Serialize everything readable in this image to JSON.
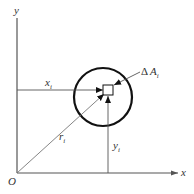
{
  "diagram": {
    "type": "polar-moment-of-inertia-element",
    "labels": {
      "y_axis": "y",
      "x_axis": "x",
      "origin": "O",
      "xi": "x",
      "xi_sub": "i",
      "yi": "y",
      "yi_sub": "i",
      "ri": "r",
      "ri_sub": "i",
      "dA_delta": "Δ",
      "dA": "A",
      "dA_sub": "i"
    },
    "colors": {
      "line": "#555555",
      "circle": "#111111",
      "text": "#333333"
    }
  }
}
